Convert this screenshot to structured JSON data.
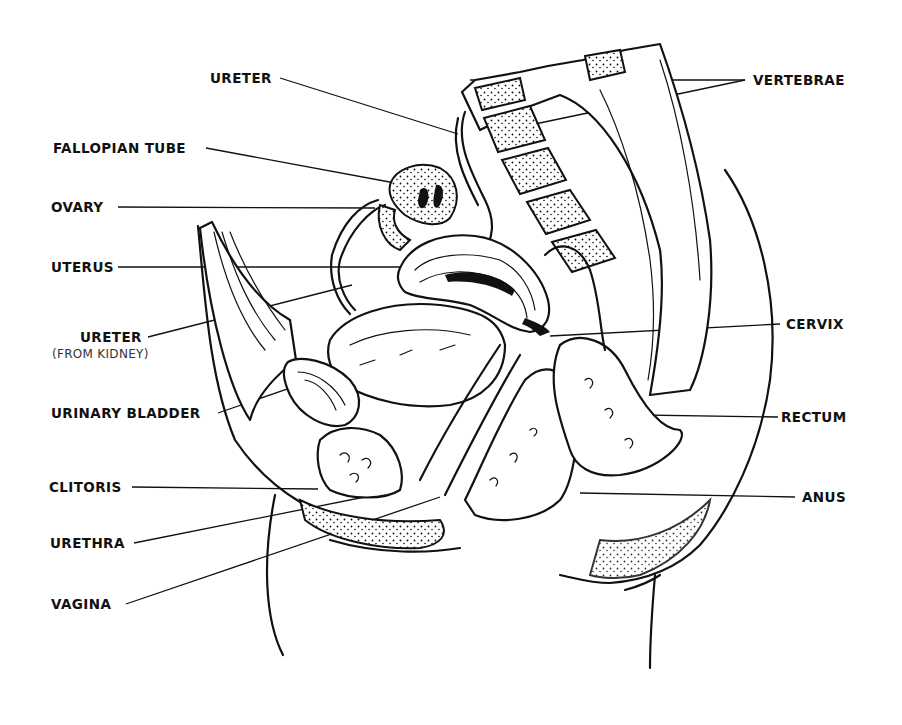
{
  "diagram": {
    "labels_left": [
      {
        "id": "ureter",
        "text": "URETER"
      },
      {
        "id": "fallopian-tube",
        "text": "FALLOPIAN TUBE"
      },
      {
        "id": "ovary",
        "text": "OVARY"
      },
      {
        "id": "uterus",
        "text": "UTERUS"
      },
      {
        "id": "ureter-kidney",
        "text": "URETER",
        "subtext": "(FROM KIDNEY)"
      },
      {
        "id": "urinary-bladder",
        "text": "URINARY BLADDER"
      },
      {
        "id": "clitoris",
        "text": "CLITORIS"
      },
      {
        "id": "urethra",
        "text": "URETHRA"
      },
      {
        "id": "vagina",
        "text": "VAGINA"
      }
    ],
    "labels_right": [
      {
        "id": "vertebrae",
        "text": "VERTEBRAE"
      },
      {
        "id": "cervix",
        "text": "CERVIX"
      },
      {
        "id": "rectum",
        "text": "RECTUM"
      },
      {
        "id": "anus",
        "text": "ANUS"
      }
    ],
    "colors": {
      "ink": "#111111",
      "background": "#ffffff"
    }
  }
}
